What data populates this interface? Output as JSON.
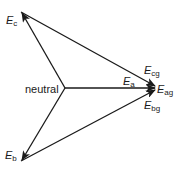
{
  "diagram": {
    "title": "",
    "line_color": "#1a1a1a",
    "nodes": {
      "neutral": {
        "label": "neutral",
        "x": 65,
        "y": 88
      },
      "Ea": {
        "label": "E",
        "sub": "a",
        "x": 156,
        "y": 88
      },
      "Eb": {
        "label": "E",
        "sub": "b",
        "x": 21,
        "y": 161
      },
      "Ec": {
        "label": "E",
        "sub": "c",
        "x": 21,
        "y": 12
      }
    },
    "labels": {
      "Ec": {
        "main": "E",
        "sub": "c"
      },
      "Eb": {
        "main": "E",
        "sub": "b"
      },
      "Ea": {
        "main": "E",
        "sub": "a"
      },
      "Ecg": {
        "main": "E",
        "sub": "cg"
      },
      "Eag": {
        "main": "E",
        "sub": "ag"
      },
      "Ebg": {
        "main": "E",
        "sub": "bg"
      },
      "neutral": "neutral"
    },
    "arrows": [
      {
        "from": "neutral",
        "to": "Ea",
        "name": "phasor-Ea"
      },
      {
        "from": "neutral",
        "to": "Ec",
        "name": "phasor-Ec"
      },
      {
        "from": "neutral",
        "to": "Eb",
        "name": "phasor-Eb"
      },
      {
        "from": "Ec",
        "to": "Ea",
        "name": "phasor-Ecg"
      },
      {
        "from": "Eb",
        "to": "Ea",
        "name": "phasor-Ebg"
      }
    ]
  }
}
